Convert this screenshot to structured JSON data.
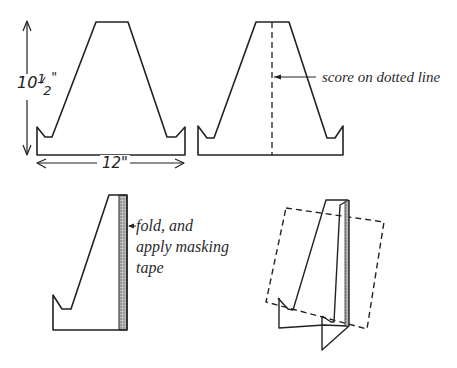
{
  "figures": {
    "fig1": {
      "height_label": "10½\"",
      "height_whole": "10",
      "height_frac_num": "1",
      "height_frac_den": "2",
      "width_label": "12\""
    },
    "fig2": {
      "annotation": "score on dotted line"
    },
    "fig3": {
      "annotation_line1": "fold, and",
      "annotation_line2": "apply masking",
      "annotation_line3": "tape"
    },
    "fig4": {
      "description": "assembled stand supporting a tilted panel (dashed)"
    }
  },
  "colors": {
    "line": "#222222",
    "tape": "#9a9a9a"
  }
}
